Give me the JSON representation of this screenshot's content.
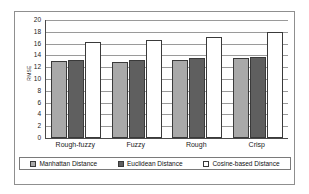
{
  "chart_data": {
    "type": "bar",
    "title": "",
    "xlabel": "",
    "ylabel": "RMSE",
    "ylim": [
      0,
      20
    ],
    "yticks": [
      20,
      18,
      16,
      14,
      12,
      10,
      8,
      6,
      4,
      2,
      0
    ],
    "grid": true,
    "legend_position": "bottom",
    "categories": [
      "Rough-fuzzy",
      "Fuzzy",
      "Rough",
      "Crisp"
    ],
    "series": [
      {
        "name": "Manhattan Distance",
        "color": "#a9a9a9",
        "swatch": "manhattan-swatch",
        "values": [
          13.0,
          12.9,
          13.2,
          13.6
        ]
      },
      {
        "name": "Euclidean Distance",
        "color": "#5f5f5f",
        "swatch": "euclidean-swatch",
        "values": [
          13.3,
          13.2,
          13.6,
          13.8
        ]
      },
      {
        "name": "Cosine-based Distance",
        "color": "#ffffff",
        "swatch": "cosine-swatch",
        "values": [
          16.2,
          16.6,
          17.2,
          18.0
        ]
      }
    ]
  }
}
